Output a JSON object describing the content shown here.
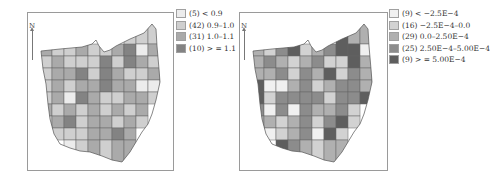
{
  "figure": {
    "panels": [
      {
        "north_label": "N",
        "legend": [
          {
            "count": "(5)",
            "range": "< 0.9",
            "label": "(5) < 0.9",
            "color": "#ececec"
          },
          {
            "count": "(42)",
            "range": "0.9–1.0",
            "label": "(42) 0.9–1.0",
            "color": "#cfcfcf"
          },
          {
            "count": "(31)",
            "range": "1.0–1.1",
            "label": "(31) 1.0–1.1",
            "color": "#aaaaaa"
          },
          {
            "count": "(10)",
            "range": "> = 1.1",
            "label": "(10) > = 1.1",
            "color": "#838383"
          }
        ]
      },
      {
        "north_label": "N",
        "legend": [
          {
            "count": "(9)",
            "range": "< −2.5E−4",
            "label": "(9) < −2.5E−4",
            "color": "#f0f0f0"
          },
          {
            "count": "(16)",
            "range": "−2.5E−4–0.0",
            "label": "(16) −2.5E−4–0.0",
            "color": "#d2d2d2"
          },
          {
            "count": "(29)",
            "range": "0.0–2.50E−4",
            "label": "(29) 0.0–2.50E−4",
            "color": "#b0b0b0"
          },
          {
            "count": "(25)",
            "range": "2.50E−4–5.00E−4",
            "label": "(25) 2.50E−4–5.00E−4",
            "color": "#8c8c8c"
          },
          {
            "count": "(9)",
            "range": "> = 5.00E−4",
            "label": "(9) > = 5.00E−4",
            "color": "#5e5e5e"
          }
        ]
      }
    ]
  }
}
